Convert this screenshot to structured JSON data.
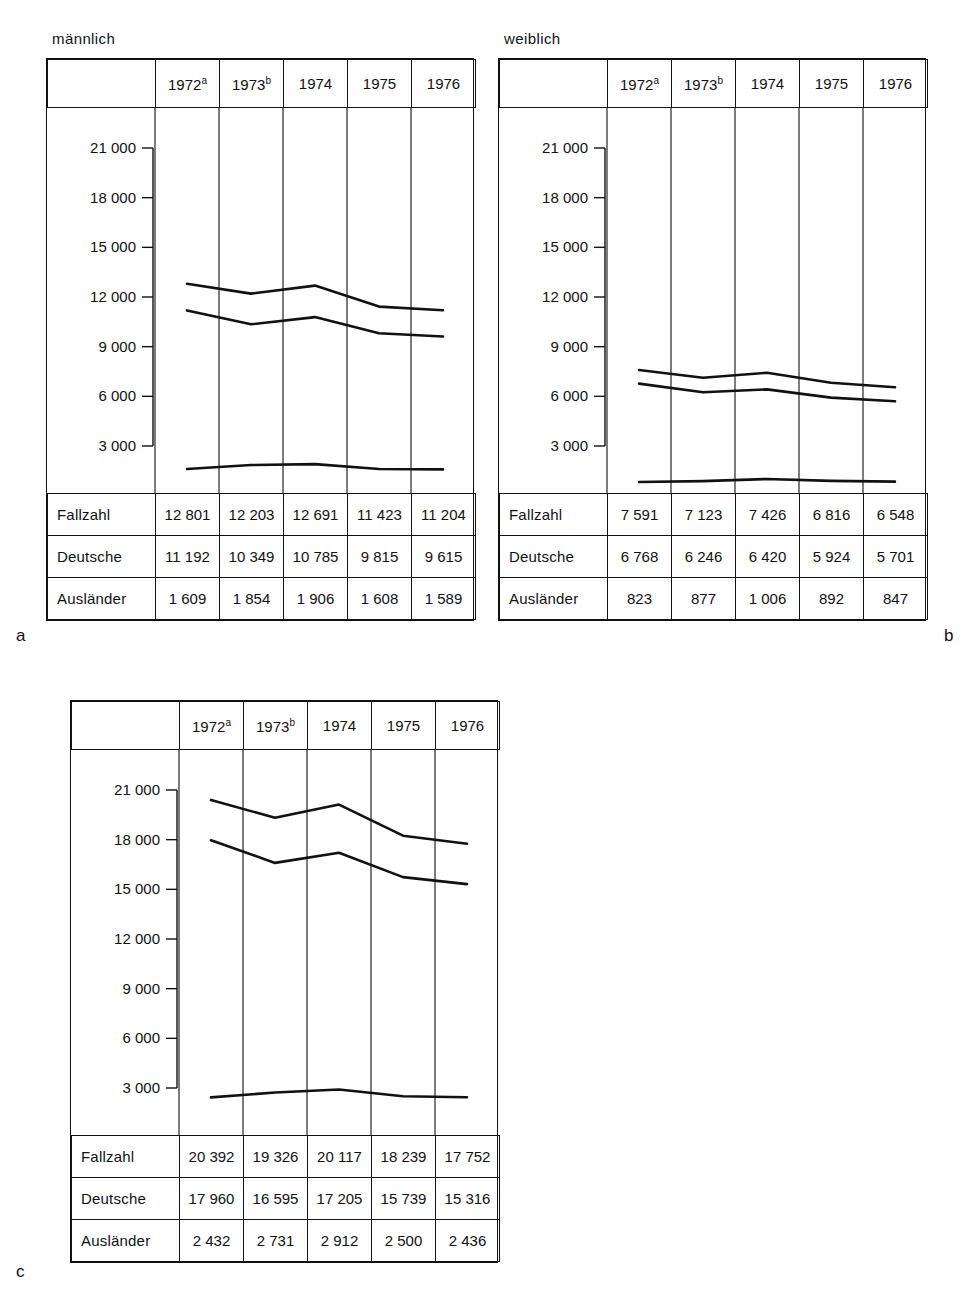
{
  "figure": {
    "panels": [
      {
        "index": "a",
        "caption": "männlich",
        "years": [
          {
            "label": "1972",
            "note": "a"
          },
          {
            "label": "1973",
            "note": "b"
          },
          {
            "label": "1974",
            "note": ""
          },
          {
            "label": "1975",
            "note": ""
          },
          {
            "label": "1976",
            "note": ""
          }
        ],
        "rows": [
          {
            "label": "Fallzahl",
            "values": [
              "12 801",
              "12 203",
              "12 691",
              "11 423",
              "11 204"
            ]
          },
          {
            "label": "Deutsche",
            "values": [
              "11 192",
              "10 349",
              "10 785",
              "9 815",
              "9 615"
            ]
          },
          {
            "label": "Ausländer",
            "values": [
              "1 609",
              "1 854",
              "1 906",
              "1 608",
              "1 589"
            ]
          }
        ]
      },
      {
        "index": "b",
        "caption": "weiblich",
        "years": [
          {
            "label": "1972",
            "note": "a"
          },
          {
            "label": "1973",
            "note": "b"
          },
          {
            "label": "1974",
            "note": ""
          },
          {
            "label": "1975",
            "note": ""
          },
          {
            "label": "1976",
            "note": ""
          }
        ],
        "rows": [
          {
            "label": "Fallzahl",
            "values": [
              "7 591",
              "7 123",
              "7 426",
              "6 816",
              "6 548"
            ]
          },
          {
            "label": "Deutsche",
            "values": [
              "6 768",
              "6 246",
              "6 420",
              "5 924",
              "5 701"
            ]
          },
          {
            "label": "Ausländer",
            "values": [
              "823",
              "877",
              "1 006",
              "892",
              "847"
            ]
          }
        ]
      },
      {
        "index": "c",
        "caption": "",
        "years": [
          {
            "label": "1972",
            "note": "a"
          },
          {
            "label": "1973",
            "note": "b"
          },
          {
            "label": "1974",
            "note": ""
          },
          {
            "label": "1975",
            "note": ""
          },
          {
            "label": "1976",
            "note": ""
          }
        ],
        "rows": [
          {
            "label": "Fallzahl",
            "values": [
              "20 392",
              "19 326",
              "20 117",
              "18 239",
              "17 752"
            ]
          },
          {
            "label": "Deutsche",
            "values": [
              "17 960",
              "16 595",
              "17 205",
              "15 739",
              "15 316"
            ]
          },
          {
            "label": "Ausländer",
            "values": [
              "2 432",
              "2 731",
              "2 912",
              "2 500",
              "2 436"
            ]
          }
        ]
      }
    ]
  },
  "chart_data": [
    {
      "type": "line",
      "panel": "a",
      "title": "männlich",
      "xlabel": "",
      "ylabel": "",
      "categories": [
        "1972",
        "1973",
        "1974",
        "1975",
        "1976"
      ],
      "ytick_labels": [
        "21 000",
        "18 000",
        "15 000",
        "12 000",
        "9 000",
        "6 000",
        "3 000"
      ],
      "yticks": [
        21000,
        18000,
        15000,
        12000,
        9000,
        6000,
        3000
      ],
      "ylim": [
        0,
        21000
      ],
      "grid": "vertical",
      "legend": "none",
      "series": [
        {
          "name": "Fallzahl",
          "values": [
            12801,
            12203,
            12691,
            11423,
            11204
          ]
        },
        {
          "name": "Deutsche",
          "values": [
            11192,
            10349,
            10785,
            9815,
            9615
          ]
        },
        {
          "name": "Ausländer",
          "values": [
            1609,
            1854,
            1906,
            1608,
            1589
          ]
        }
      ]
    },
    {
      "type": "line",
      "panel": "b",
      "title": "weiblich",
      "xlabel": "",
      "ylabel": "",
      "categories": [
        "1972",
        "1973",
        "1974",
        "1975",
        "1976"
      ],
      "ytick_labels": [
        "21 000",
        "18 000",
        "15 000",
        "12 000",
        "9 000",
        "6 000",
        "3 000"
      ],
      "yticks": [
        21000,
        18000,
        15000,
        12000,
        9000,
        6000,
        3000
      ],
      "ylim": [
        0,
        21000
      ],
      "grid": "vertical",
      "legend": "none",
      "series": [
        {
          "name": "Fallzahl",
          "values": [
            7591,
            7123,
            7426,
            6816,
            6548
          ]
        },
        {
          "name": "Deutsche",
          "values": [
            6768,
            6246,
            6420,
            5924,
            5701
          ]
        },
        {
          "name": "Ausländer",
          "values": [
            823,
            877,
            1006,
            892,
            847
          ]
        }
      ]
    },
    {
      "type": "line",
      "panel": "c",
      "title": "",
      "xlabel": "",
      "ylabel": "",
      "categories": [
        "1972",
        "1973",
        "1974",
        "1975",
        "1976"
      ],
      "ytick_labels": [
        "21 000",
        "18 000",
        "15 000",
        "12 000",
        "9 000",
        "6 000",
        "3 000"
      ],
      "yticks": [
        21000,
        18000,
        15000,
        12000,
        9000,
        6000,
        3000
      ],
      "ylim": [
        0,
        21000
      ],
      "grid": "vertical",
      "legend": "none",
      "series": [
        {
          "name": "Fallzahl",
          "values": [
            20392,
            19326,
            20117,
            18239,
            17752
          ]
        },
        {
          "name": "Deutsche",
          "values": [
            17960,
            16595,
            17205,
            15739,
            15316
          ]
        },
        {
          "name": "Ausländer",
          "values": [
            2432,
            2731,
            2912,
            2500,
            2436
          ]
        }
      ]
    }
  ]
}
